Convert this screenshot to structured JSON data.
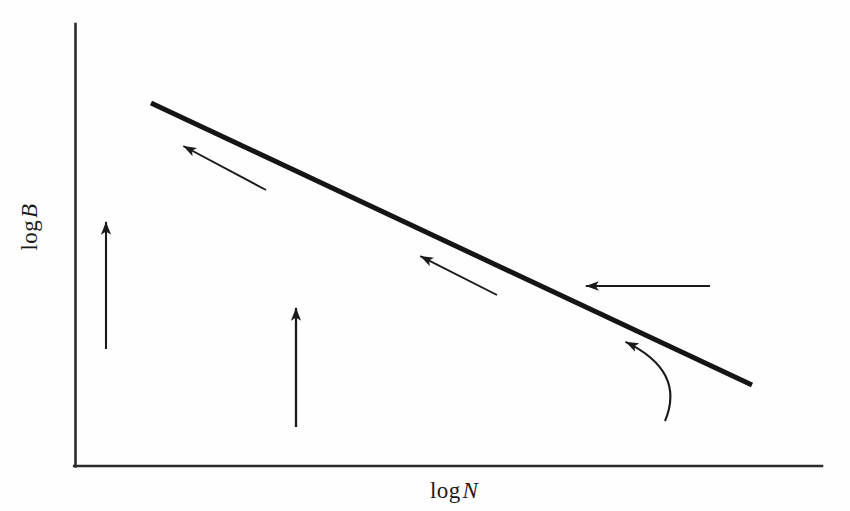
{
  "figure": {
    "title": "",
    "background_color": "#fefefe",
    "ink_color": "#1a1a1a"
  },
  "axes": {
    "x_label_prefix": "log",
    "x_label_variable": "N",
    "x_label_full": "log N",
    "y_label_prefix": "log",
    "y_label_variable": "B",
    "y_label_full": "log B",
    "x_axis_line": {
      "x1": 75,
      "y1": 466,
      "x2": 822,
      "y2": 466
    },
    "y_axis_line": {
      "x1": 75,
      "y1": 24,
      "x2": 75,
      "y2": 466
    },
    "tick_labels_x": [],
    "tick_labels_y": [],
    "grid": false
  },
  "chart_data": {
    "type": "line",
    "title": "",
    "subtitle": "",
    "xlabel": "log N",
    "ylabel": "log B",
    "grid": false,
    "legend": null,
    "axis_style": "schematic-no-ticks",
    "xlim": [
      0,
      1
    ],
    "ylim": [
      0,
      1
    ],
    "series": [
      {
        "name": "log B vs log N relation",
        "type": "line",
        "style": "solid",
        "line_width": 5,
        "color": "#151515",
        "points_px": [
          [
            151,
            103
          ],
          [
            752,
            385
          ]
        ],
        "x": [
          0.102,
          0.907
        ],
        "y": [
          0.821,
          0.183
        ],
        "slope_sign": "negative",
        "description": "Thick straight descending line (power-law relation) from upper-left to lower-right"
      }
    ],
    "annotations": [
      {
        "name": "arrow-up-left-upper",
        "kind": "straight-arrow",
        "direction": "up-left",
        "tail_px": [
          266,
          190
        ],
        "head_px": [
          187,
          148
        ],
        "label": ""
      },
      {
        "name": "arrow-up-left-middle",
        "kind": "straight-arrow",
        "direction": "up-left",
        "tail_px": [
          497,
          295
        ],
        "head_px": [
          424,
          258
        ],
        "label": ""
      },
      {
        "name": "arrow-left-horizontal",
        "kind": "straight-arrow",
        "direction": "left",
        "tail_px": [
          710,
          286
        ],
        "head_px": [
          590,
          286
        ],
        "label": ""
      },
      {
        "name": "arrow-up-vertical-left",
        "kind": "straight-arrow",
        "direction": "up",
        "tail_px": [
          106,
          349
        ],
        "head_px": [
          106,
          226
        ],
        "label": ""
      },
      {
        "name": "arrow-up-vertical-center",
        "kind": "straight-arrow",
        "direction": "up",
        "tail_px": [
          296,
          427
        ],
        "head_px": [
          296,
          312
        ],
        "label": ""
      },
      {
        "name": "arrow-curved-up-left",
        "kind": "curved-arrow",
        "direction": "up-left",
        "tail_px": [
          665,
          421
        ],
        "head_px": [
          630,
          344
        ],
        "control_px": [
          686,
          371
        ],
        "label": ""
      }
    ]
  }
}
